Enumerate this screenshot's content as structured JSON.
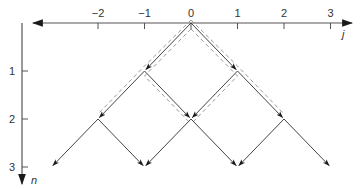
{
  "diagram": {
    "type": "lattice-path-diagram",
    "colors": {
      "axis": "#555555",
      "edge": "#444444",
      "arrowhead": "#1a1a1a",
      "dashed": "#999999",
      "background": "#ffffff"
    },
    "x_axis": {
      "name": "j",
      "ticks": [
        {
          "value": -2,
          "label": "−2"
        },
        {
          "value": -1,
          "label": "−1"
        },
        {
          "value": 0,
          "label": "0"
        },
        {
          "value": 1,
          "label": "1"
        },
        {
          "value": 2,
          "label": "2"
        },
        {
          "value": 3,
          "label": "3"
        }
      ]
    },
    "y_axis": {
      "name": "n",
      "ticks": [
        {
          "value": 1,
          "label": "1"
        },
        {
          "value": 2,
          "label": "2"
        },
        {
          "value": 3,
          "label": "3"
        }
      ]
    },
    "edges": [
      {
        "from": [
          0,
          0
        ],
        "to": [
          -1,
          1
        ]
      },
      {
        "from": [
          0,
          0
        ],
        "to": [
          1,
          1
        ]
      },
      {
        "from": [
          -1,
          1
        ],
        "to": [
          -2,
          2
        ]
      },
      {
        "from": [
          -1,
          1
        ],
        "to": [
          0,
          2
        ]
      },
      {
        "from": [
          1,
          1
        ],
        "to": [
          0,
          2
        ]
      },
      {
        "from": [
          1,
          1
        ],
        "to": [
          2,
          2
        ]
      },
      {
        "from": [
          -2,
          2
        ],
        "to": [
          -3,
          3
        ]
      },
      {
        "from": [
          -2,
          2
        ],
        "to": [
          -1,
          3
        ]
      },
      {
        "from": [
          0,
          2
        ],
        "to": [
          -1,
          3
        ]
      },
      {
        "from": [
          0,
          2
        ],
        "to": [
          1,
          3
        ]
      },
      {
        "from": [
          2,
          2
        ],
        "to": [
          1,
          3
        ]
      },
      {
        "from": [
          2,
          2
        ],
        "to": [
          3,
          3
        ]
      }
    ],
    "dashed_paths": [
      {
        "points": [
          [
            0,
            0
          ],
          [
            -1,
            1
          ],
          [
            0,
            2
          ]
        ],
        "side": "inner"
      },
      {
        "points": [
          [
            0,
            0
          ],
          [
            1,
            1
          ],
          [
            0,
            2
          ]
        ],
        "side": "inner"
      },
      {
        "points": [
          [
            0,
            0
          ],
          [
            -1,
            1
          ],
          [
            -2,
            2
          ]
        ],
        "side": "outer"
      },
      {
        "points": [
          [
            0,
            0
          ],
          [
            1,
            1
          ],
          [
            2,
            2
          ]
        ],
        "side": "outer"
      }
    ]
  }
}
